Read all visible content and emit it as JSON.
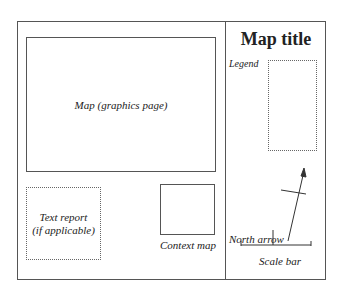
{
  "diagram": {
    "map_area_label": "Map (graphics page)",
    "text_report_label_line1": "Text report",
    "text_report_label_line2": "(if applicable)",
    "context_map_label": "Context map",
    "title": "Map title",
    "legend_label": "Legend",
    "north_arrow_label": "North arrow",
    "scale_bar_label": "Scale bar"
  }
}
